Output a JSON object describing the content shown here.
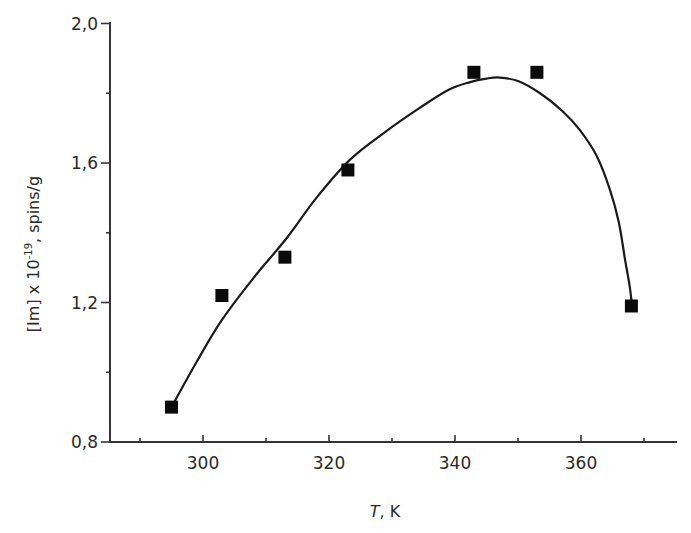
{
  "chart_data": {
    "type": "scatter",
    "title": "",
    "xlabel": "T, K",
    "xlabel_italic_part": "T",
    "xlabel_rest": ", K",
    "ylabel": "[Im] x 10^-19, spins/g",
    "ylabel_parts": {
      "base": "[Im] x 10",
      "sup": "-19",
      "rest": ", spins/g"
    },
    "xlim": [
      285,
      377
    ],
    "ylim": [
      0.8,
      2.0
    ],
    "x_major_ticks": [
      300,
      320,
      340,
      360
    ],
    "x_minor_ticks": [
      290,
      310,
      330,
      350,
      370
    ],
    "y_major_ticks": [
      0.8,
      1.2,
      1.6,
      2.0
    ],
    "y_tick_labels": [
      "0,8",
      "1,2",
      "1,6",
      "2,0"
    ],
    "y_minor_ticks": [
      1.0,
      1.4,
      1.8
    ],
    "grid": false,
    "legend": null,
    "series": [
      {
        "name": "measured",
        "marker": "square",
        "color": "#0a0a0a",
        "x": [
          295,
          303,
          313,
          323,
          343,
          353,
          368
        ],
        "y": [
          0.9,
          1.22,
          1.33,
          1.58,
          1.86,
          1.86,
          1.19
        ]
      },
      {
        "name": "fit",
        "style": "line",
        "color": "#1a1a1a",
        "x": [
          295,
          299,
          303,
          308,
          313.3,
          318,
          323.3,
          329,
          334.4,
          339,
          342.4,
          345,
          347.1,
          350,
          353.5,
          357,
          359.8,
          362.5,
          364.6,
          366,
          367,
          367.7,
          368.1
        ],
        "y": [
          0.9,
          1.03,
          1.15,
          1.27,
          1.385,
          1.5,
          1.609,
          1.69,
          1.758,
          1.81,
          1.832,
          1.842,
          1.845,
          1.835,
          1.8,
          1.75,
          1.695,
          1.62,
          1.523,
          1.43,
          1.322,
          1.25,
          1.193
        ]
      }
    ]
  },
  "layout": {
    "x0_px": 203,
    "x0_val": 300,
    "px_per_x": 6.3,
    "y0_px": 442,
    "y0_val": 0.8,
    "px_per_y": 348.75,
    "axis_left_px": 110,
    "axis_right_px": 677,
    "axis_top_px": 22,
    "axis_bottom_px": 442
  }
}
